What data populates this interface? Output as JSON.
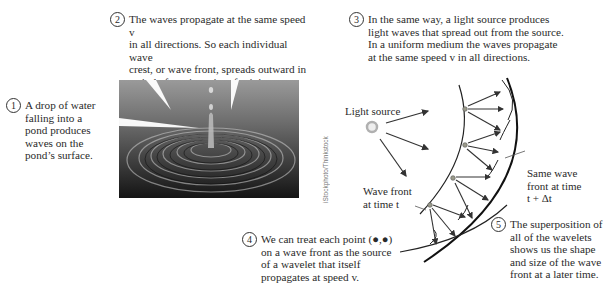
{
  "captions": [
    {
      "number": "1",
      "text": "A drop of water\nfalling into a\npond produces\nwaves on the\npond’s surface."
    },
    {
      "number": "2",
      "text": "The waves propagate at the same speed v\nin all directions. So each individual wave\ncrest, or wave front, spreads outward in\na circle from its point of origin."
    },
    {
      "number": "3",
      "text": "In the same way, a light source produces\nlight waves that spread out from the source.\nIn a uniform medium the waves propagate\nat the same speed v in all directions."
    },
    {
      "number": "4",
      "text": "We can treat each point (●,●)\non a wave front as the source\nof a wavelet that itself\npropagates at speed v."
    },
    {
      "number": "5",
      "text": "The superposition of\nall of the wavelets\nshows us the shape\nand size of the wave\nfront at a later time."
    }
  ],
  "photo": {
    "subject": "water-drop-ripples",
    "credit": "iStockphoto/Thinkstock"
  },
  "diagram": {
    "light_source_label": "Light source",
    "wave_front_t_label": "Wave front\nat time t",
    "wave_front_later_label": "Same wave\nfront at time\nt + Δt",
    "colors": {
      "line": "#222222",
      "arrow": "#333333",
      "dot": "#9a9a8a",
      "source_ring": "#b0b0b0"
    }
  }
}
